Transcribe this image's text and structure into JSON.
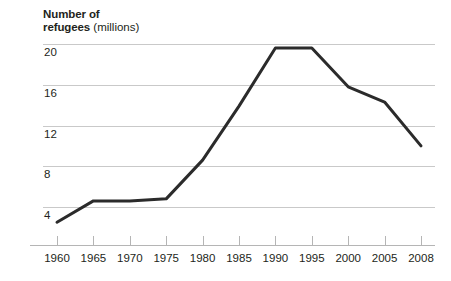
{
  "chart_data": {
    "type": "line",
    "title": "Number of refugees (millions)",
    "title_bold_part": "Number of",
    "title_bold_part2": "refugees",
    "title_unit": "(millions)",
    "xlabel": "",
    "ylabel": "Number of refugees (millions)",
    "categories": [
      "1960",
      "1965",
      "1970",
      "1975",
      "1980",
      "1985",
      "1990",
      "1995",
      "2000",
      "2005",
      "2008"
    ],
    "x": [
      1960,
      1965,
      1970,
      1975,
      1980,
      1985,
      1990,
      1995,
      2000,
      2005,
      2008
    ],
    "values": [
      2.5,
      4.6,
      4.6,
      4.8,
      8.6,
      13.9,
      19.6,
      19.6,
      15.8,
      14.3,
      10.0
    ],
    "series": [
      {
        "name": "Number of refugees",
        "values": [
          2.5,
          4.6,
          4.6,
          4.8,
          8.6,
          13.9,
          19.6,
          19.6,
          15.8,
          14.3,
          10.0
        ]
      }
    ],
    "ylim": [
      0,
      21.2
    ],
    "yticks": [
      4,
      8,
      12,
      16,
      20
    ],
    "ytick_labels": [
      "4",
      "8",
      "12",
      "16",
      "20"
    ],
    "grid": true,
    "grid_axis": "y",
    "legend": false,
    "legend_position": "none",
    "line_color": "#2b2b2b",
    "grid_color": "#c9c9c9",
    "axis_color": "#b5b5b5",
    "background_color": "#ffffff",
    "text_color": "#231f20",
    "note": "Equal pixel spacing is used between all category ticks even though the final interval 2005-2008 spans three years."
  }
}
